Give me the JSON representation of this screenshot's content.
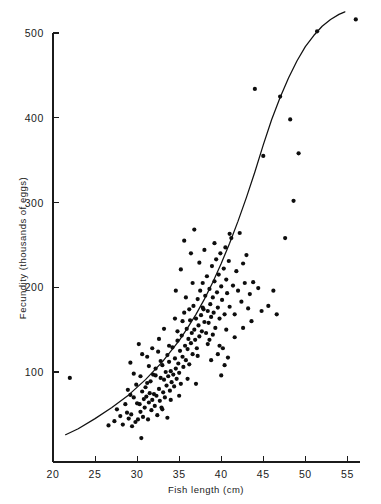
{
  "figure": {
    "background_color": "#ffffff",
    "ink_color": "#111111"
  },
  "chart_data": {
    "type": "scatter",
    "title": "",
    "subtitle": "",
    "xlabel": "Fish length (cm)",
    "ylabel": "Fecundity (thousands of eggs)",
    "xlim": [
      20,
      56.5
    ],
    "ylim": [
      0,
      525
    ],
    "xticks": [
      20,
      25,
      30,
      35,
      40,
      45,
      50,
      55
    ],
    "yticks": [
      100,
      200,
      300,
      400,
      500
    ],
    "xtick_labels": [
      "20",
      "25",
      "30",
      "35",
      "40",
      "45",
      "50",
      "55"
    ],
    "ytick_labels": [
      "100",
      "200",
      "300",
      "400",
      "500"
    ],
    "grid": false,
    "legend": null,
    "legend_position": "none",
    "annotations": [],
    "series": [
      {
        "name": "Observations",
        "type": "scatter",
        "marker": "filled-circle",
        "color": "#0d0d0d",
        "points": [
          [
            22.0,
            93
          ],
          [
            26.6,
            37
          ],
          [
            27.3,
            42
          ],
          [
            27.6,
            56
          ],
          [
            28.0,
            48
          ],
          [
            28.3,
            38
          ],
          [
            28.6,
            62
          ],
          [
            28.9,
            79
          ],
          [
            29.0,
            45
          ],
          [
            29.2,
            111
          ],
          [
            29.3,
            50
          ],
          [
            29.4,
            36
          ],
          [
            29.6,
            70
          ],
          [
            29.8,
            41
          ],
          [
            29.9,
            85
          ],
          [
            30.1,
            44
          ],
          [
            30.2,
            133
          ],
          [
            30.3,
            62
          ],
          [
            30.4,
            53
          ],
          [
            30.5,
            22
          ],
          [
            30.6,
            77
          ],
          [
            30.7,
            47
          ],
          [
            30.8,
            68
          ],
          [
            30.9,
            58
          ],
          [
            31.0,
            82
          ],
          [
            31.1,
            71
          ],
          [
            31.2,
            118
          ],
          [
            31.3,
            44
          ],
          [
            31.4,
            64
          ],
          [
            31.5,
            75
          ],
          [
            31.6,
            89
          ],
          [
            31.7,
            55
          ],
          [
            31.8,
            67
          ],
          [
            31.9,
            97
          ],
          [
            32.0,
            74
          ],
          [
            32.1,
            60
          ],
          [
            32.2,
            104
          ],
          [
            32.3,
            72
          ],
          [
            32.4,
            49
          ],
          [
            32.5,
            124
          ],
          [
            32.6,
            80
          ],
          [
            32.7,
            66
          ],
          [
            32.8,
            93
          ],
          [
            32.9,
            58
          ],
          [
            33.0,
            108
          ],
          [
            33.1,
            76
          ],
          [
            33.2,
            91
          ],
          [
            33.3,
            70
          ],
          [
            33.4,
            100
          ],
          [
            33.5,
            84
          ],
          [
            33.6,
            46
          ],
          [
            33.7,
            95
          ],
          [
            33.8,
            112
          ],
          [
            33.9,
            78
          ],
          [
            34.0,
            101
          ],
          [
            34.1,
            88
          ],
          [
            34.2,
            129
          ],
          [
            34.3,
            97
          ],
          [
            34.4,
            83
          ],
          [
            34.5,
            116
          ],
          [
            34.6,
            104
          ],
          [
            34.7,
            92
          ],
          [
            34.8,
            137
          ],
          [
            34.9,
            110
          ],
          [
            35.0,
            99
          ],
          [
            35.1,
            125
          ],
          [
            35.2,
            86
          ],
          [
            35.3,
            143
          ],
          [
            35.4,
            118
          ],
          [
            35.5,
            106
          ],
          [
            35.6,
            170
          ],
          [
            35.7,
            131
          ],
          [
            35.8,
            114
          ],
          [
            35.9,
            151
          ],
          [
            36.0,
            127
          ],
          [
            36.1,
            139
          ],
          [
            36.2,
            109
          ],
          [
            36.3,
            161
          ],
          [
            36.4,
            134
          ],
          [
            36.5,
            146
          ],
          [
            36.6,
            121
          ],
          [
            36.7,
            178
          ],
          [
            36.8,
            150
          ],
          [
            36.9,
            138
          ],
          [
            37.0,
            163
          ],
          [
            37.1,
            128
          ],
          [
            37.2,
            186
          ],
          [
            37.3,
            155
          ],
          [
            37.4,
            142
          ],
          [
            37.5,
            196
          ],
          [
            37.6,
            167
          ],
          [
            37.7,
            148
          ],
          [
            37.8,
            205
          ],
          [
            37.9,
            174
          ],
          [
            38.0,
            159
          ],
          [
            38.1,
            190
          ],
          [
            38.2,
            146
          ],
          [
            38.3,
            213
          ],
          [
            38.4,
            172
          ],
          [
            38.5,
            158
          ],
          [
            38.6,
            198
          ],
          [
            38.7,
            180
          ],
          [
            38.8,
            165
          ],
          [
            38.9,
            225
          ],
          [
            39.0,
            188
          ],
          [
            39.1,
            170
          ],
          [
            39.2,
            207
          ],
          [
            39.3,
            152
          ],
          [
            39.4,
            233
          ],
          [
            39.5,
            194
          ],
          [
            39.6,
            176
          ],
          [
            39.7,
            215
          ],
          [
            39.8,
            163
          ],
          [
            39.9,
            240
          ],
          [
            40.0,
            201
          ],
          [
            40.1,
            185
          ],
          [
            40.2,
            128
          ],
          [
            40.3,
            222
          ],
          [
            40.4,
            168
          ],
          [
            40.5,
            247
          ],
          [
            40.6,
            209
          ],
          [
            40.7,
            193
          ],
          [
            40.8,
            117
          ],
          [
            40.9,
            231
          ],
          [
            41.0,
            177
          ],
          [
            41.2,
            258
          ],
          [
            41.4,
            202
          ],
          [
            41.6,
            141
          ],
          [
            41.8,
            219
          ],
          [
            42.0,
            196
          ],
          [
            42.2,
            264
          ],
          [
            42.4,
            183
          ],
          [
            42.6,
            228
          ],
          [
            42.8,
            205
          ],
          [
            43.0,
            238
          ],
          [
            43.2,
            175
          ],
          [
            43.4,
            192
          ],
          [
            43.6,
            160
          ],
          [
            44.0,
            434
          ],
          [
            44.4,
            199
          ],
          [
            44.8,
            172
          ],
          [
            45.0,
            355
          ],
          [
            45.6,
            178
          ],
          [
            46.2,
            196
          ],
          [
            46.6,
            168
          ],
          [
            47.0,
            425
          ],
          [
            47.6,
            258
          ],
          [
            48.2,
            398
          ],
          [
            48.6,
            302
          ],
          [
            49.2,
            358
          ],
          [
            51.4,
            502
          ],
          [
            56.0,
            516
          ],
          [
            33.2,
            151
          ],
          [
            34.5,
            163
          ],
          [
            35.8,
            188
          ],
          [
            36.6,
            205
          ],
          [
            37.2,
            119
          ],
          [
            38.4,
            133
          ],
          [
            39.6,
            121
          ],
          [
            40.4,
            108
          ],
          [
            32.6,
            139
          ],
          [
            31.8,
            128
          ],
          [
            36.0,
            92
          ],
          [
            37.0,
            86
          ],
          [
            34.0,
            67
          ],
          [
            35.0,
            72
          ],
          [
            33.0,
            56
          ],
          [
            31.4,
            107
          ],
          [
            30.6,
            121
          ],
          [
            29.6,
            98
          ],
          [
            38.8,
            114
          ],
          [
            40.0,
            96
          ],
          [
            36.4,
            240
          ],
          [
            35.2,
            221
          ],
          [
            34.6,
            196
          ],
          [
            39.2,
            252
          ],
          [
            38.0,
            244
          ],
          [
            37.4,
            229
          ],
          [
            36.8,
            268
          ],
          [
            35.6,
            255
          ],
          [
            41.0,
            263
          ],
          [
            42.6,
            152
          ],
          [
            43.8,
            206
          ],
          [
            32.2,
            96
          ],
          [
            33.8,
            131
          ],
          [
            30.0,
            63
          ],
          [
            28.8,
            52
          ],
          [
            37.8,
            176
          ],
          [
            39.0,
            144
          ],
          [
            40.6,
            150
          ],
          [
            41.6,
            168
          ],
          [
            36.2,
            174
          ],
          [
            35.4,
            160
          ],
          [
            34.8,
            148
          ],
          [
            33.6,
            120
          ],
          [
            32.8,
            113
          ],
          [
            31.2,
            87
          ],
          [
            30.4,
            95
          ],
          [
            29.2,
            73
          ],
          [
            38.6,
            138
          ],
          [
            39.8,
            131
          ]
        ]
      },
      {
        "name": "Fitted curve",
        "type": "line",
        "color": "#111111",
        "points": [
          [
            21.5,
            26
          ],
          [
            23.0,
            33
          ],
          [
            25.0,
            45
          ],
          [
            27.0,
            58
          ],
          [
            29.0,
            73
          ],
          [
            31.0,
            91
          ],
          [
            33.0,
            112
          ],
          [
            35.0,
            137
          ],
          [
            36.0,
            152
          ],
          [
            37.0,
            168
          ],
          [
            38.0,
            186
          ],
          [
            39.0,
            206
          ],
          [
            40.0,
            228
          ],
          [
            41.0,
            252
          ],
          [
            42.0,
            278
          ],
          [
            43.0,
            306
          ],
          [
            44.0,
            336
          ],
          [
            45.0,
            368
          ],
          [
            46.0,
            398
          ],
          [
            47.0,
            424
          ],
          [
            48.0,
            447
          ],
          [
            49.0,
            467
          ],
          [
            50.0,
            484
          ],
          [
            51.0,
            497
          ],
          [
            52.0,
            508
          ],
          [
            53.0,
            516
          ],
          [
            54.0,
            522
          ],
          [
            54.7,
            525
          ]
        ]
      }
    ]
  }
}
